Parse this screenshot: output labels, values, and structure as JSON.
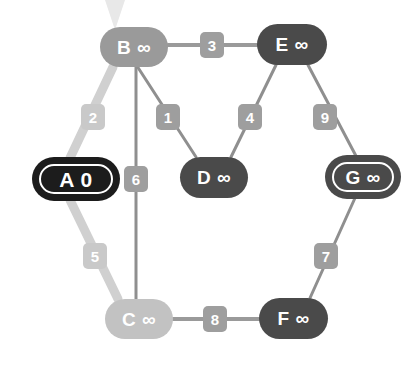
{
  "diagram": {
    "background_color": "#ffffff",
    "infinity_symbol": "∞"
  },
  "palette": {
    "node_dark": "#4a4a4a",
    "node_medium": "#9a9a9a",
    "node_light": "#c2c2c2",
    "node_start": "#1c1c1c",
    "edge_thin": "#8f8f8f",
    "edge_highlight": "#d0d0d0",
    "label_light": "#c9c9c9",
    "label_medium": "#9e9e9e",
    "label_dark": "#8a8a8a",
    "ring_white": "#ffffff",
    "text_white": "#ffffff"
  },
  "nodes": [
    {
      "id": "A",
      "name": "A",
      "distance": "0",
      "label": "A 0",
      "x": 33,
      "y": 158,
      "w": 86,
      "h": 42,
      "fill": "#1c1c1c",
      "style": "start-visited",
      "ring": true,
      "font_size": 21
    },
    {
      "id": "B",
      "name": "B",
      "distance": "∞",
      "label": "B ∞",
      "x": 100,
      "y": 27,
      "w": 68,
      "h": 40,
      "fill": "#9a9a9a",
      "style": "frontier",
      "ring": false,
      "font_size": 19
    },
    {
      "id": "C",
      "name": "C",
      "distance": "∞",
      "label": "C ∞",
      "x": 105,
      "y": 299,
      "w": 68,
      "h": 40,
      "fill": "#c2c2c2",
      "style": "frontier-far",
      "ring": false,
      "font_size": 19
    },
    {
      "id": "D",
      "name": "D",
      "distance": "∞",
      "label": "D ∞",
      "x": 180,
      "y": 157,
      "w": 68,
      "h": 41,
      "fill": "#4a4a4a",
      "style": "unvisited",
      "ring": false,
      "font_size": 19
    },
    {
      "id": "E",
      "name": "E",
      "distance": "∞",
      "label": "E ∞",
      "x": 257,
      "y": 24,
      "w": 70,
      "h": 41,
      "fill": "#4a4a4a",
      "style": "unvisited",
      "ring": false,
      "font_size": 19
    },
    {
      "id": "F",
      "name": "F",
      "distance": "∞",
      "label": "F ∞",
      "x": 259,
      "y": 298,
      "w": 69,
      "h": 41,
      "fill": "#4a4a4a",
      "style": "unvisited",
      "ring": false,
      "font_size": 19
    },
    {
      "id": "G",
      "name": "G",
      "distance": "∞",
      "label": "G ∞",
      "x": 326,
      "y": 156,
      "w": 74,
      "h": 42,
      "fill": "#4a4a4a",
      "style": "unvisited-ringed",
      "ring": true,
      "font_size": 19
    }
  ],
  "edges": [
    {
      "id": "B-D",
      "from": "B",
      "to": "D",
      "weight": "1",
      "x1": 137,
      "y1": 66,
      "x2": 196,
      "y2": 157,
      "stroke": "#8f8f8f",
      "width": 3,
      "highlighted": false,
      "label_x": 156,
      "label_y": 104,
      "label_w": 24,
      "label_h": 26,
      "label_fill": "#9e9e9e"
    },
    {
      "id": "A-B",
      "from": "A",
      "to": "B",
      "weight": "2",
      "x1": 113,
      "y1": 67,
      "x2": 70,
      "y2": 158,
      "stroke": "#d0d0d0",
      "width": 9,
      "highlighted": true,
      "label_x": 81,
      "label_y": 104,
      "label_w": 24,
      "label_h": 26,
      "label_fill": "#c9c9c9"
    },
    {
      "id": "B-E",
      "from": "B",
      "to": "E",
      "weight": "3",
      "x1": 168,
      "y1": 45,
      "x2": 257,
      "y2": 45,
      "stroke": "#9a9a9a",
      "width": 4,
      "highlighted": false,
      "label_x": 200,
      "label_y": 32,
      "label_w": 24,
      "label_h": 26,
      "label_fill": "#9e9e9e"
    },
    {
      "id": "D-E",
      "from": "D",
      "to": "E",
      "weight": "4",
      "x1": 231,
      "y1": 157,
      "x2": 276,
      "y2": 65,
      "stroke": "#8f8f8f",
      "width": 3,
      "highlighted": false,
      "label_x": 238,
      "label_y": 104,
      "label_w": 24,
      "label_h": 26,
      "label_fill": "#9e9e9e"
    },
    {
      "id": "A-C",
      "from": "A",
      "to": "C",
      "weight": "5",
      "x1": 70,
      "y1": 200,
      "x2": 118,
      "y2": 299,
      "stroke": "#d0d0d0",
      "width": 9,
      "highlighted": true,
      "label_x": 83,
      "label_y": 243,
      "label_w": 24,
      "label_h": 26,
      "label_fill": "#c9c9c9"
    },
    {
      "id": "B-C",
      "from": "B",
      "to": "C",
      "weight": "6",
      "x1": 136,
      "y1": 66,
      "x2": 136,
      "y2": 300,
      "stroke": "#8f8f8f",
      "width": 3,
      "highlighted": false,
      "label_x": 124,
      "label_y": 166,
      "label_w": 24,
      "label_h": 26,
      "label_fill": "#9e9e9e"
    },
    {
      "id": "F-G",
      "from": "F",
      "to": "G",
      "weight": "7",
      "x1": 310,
      "y1": 298,
      "x2": 355,
      "y2": 198,
      "stroke": "#8f8f8f",
      "width": 3,
      "highlighted": false,
      "label_x": 314,
      "label_y": 243,
      "label_w": 24,
      "label_h": 26,
      "label_fill": "#9e9e9e"
    },
    {
      "id": "C-F",
      "from": "C",
      "to": "F",
      "weight": "8",
      "x1": 173,
      "y1": 319,
      "x2": 259,
      "y2": 319,
      "stroke": "#9a9a9a",
      "width": 4,
      "highlighted": false,
      "label_x": 203,
      "label_y": 306,
      "label_w": 24,
      "label_h": 26,
      "label_fill": "#9e9e9e"
    },
    {
      "id": "E-G",
      "from": "E",
      "to": "G",
      "weight": "9",
      "x1": 308,
      "y1": 65,
      "x2": 356,
      "y2": 156,
      "stroke": "#8f8f8f",
      "width": 3,
      "highlighted": false,
      "label_x": 313,
      "label_y": 104,
      "label_w": 24,
      "label_h": 26,
      "label_fill": "#9e9e9e"
    }
  ],
  "artifacts": [
    {
      "id": "top-pointer",
      "name": "cursor-artifact",
      "x": 105,
      "y": 0,
      "w": 20,
      "h": 30,
      "color": "#e8e8e8"
    }
  ]
}
